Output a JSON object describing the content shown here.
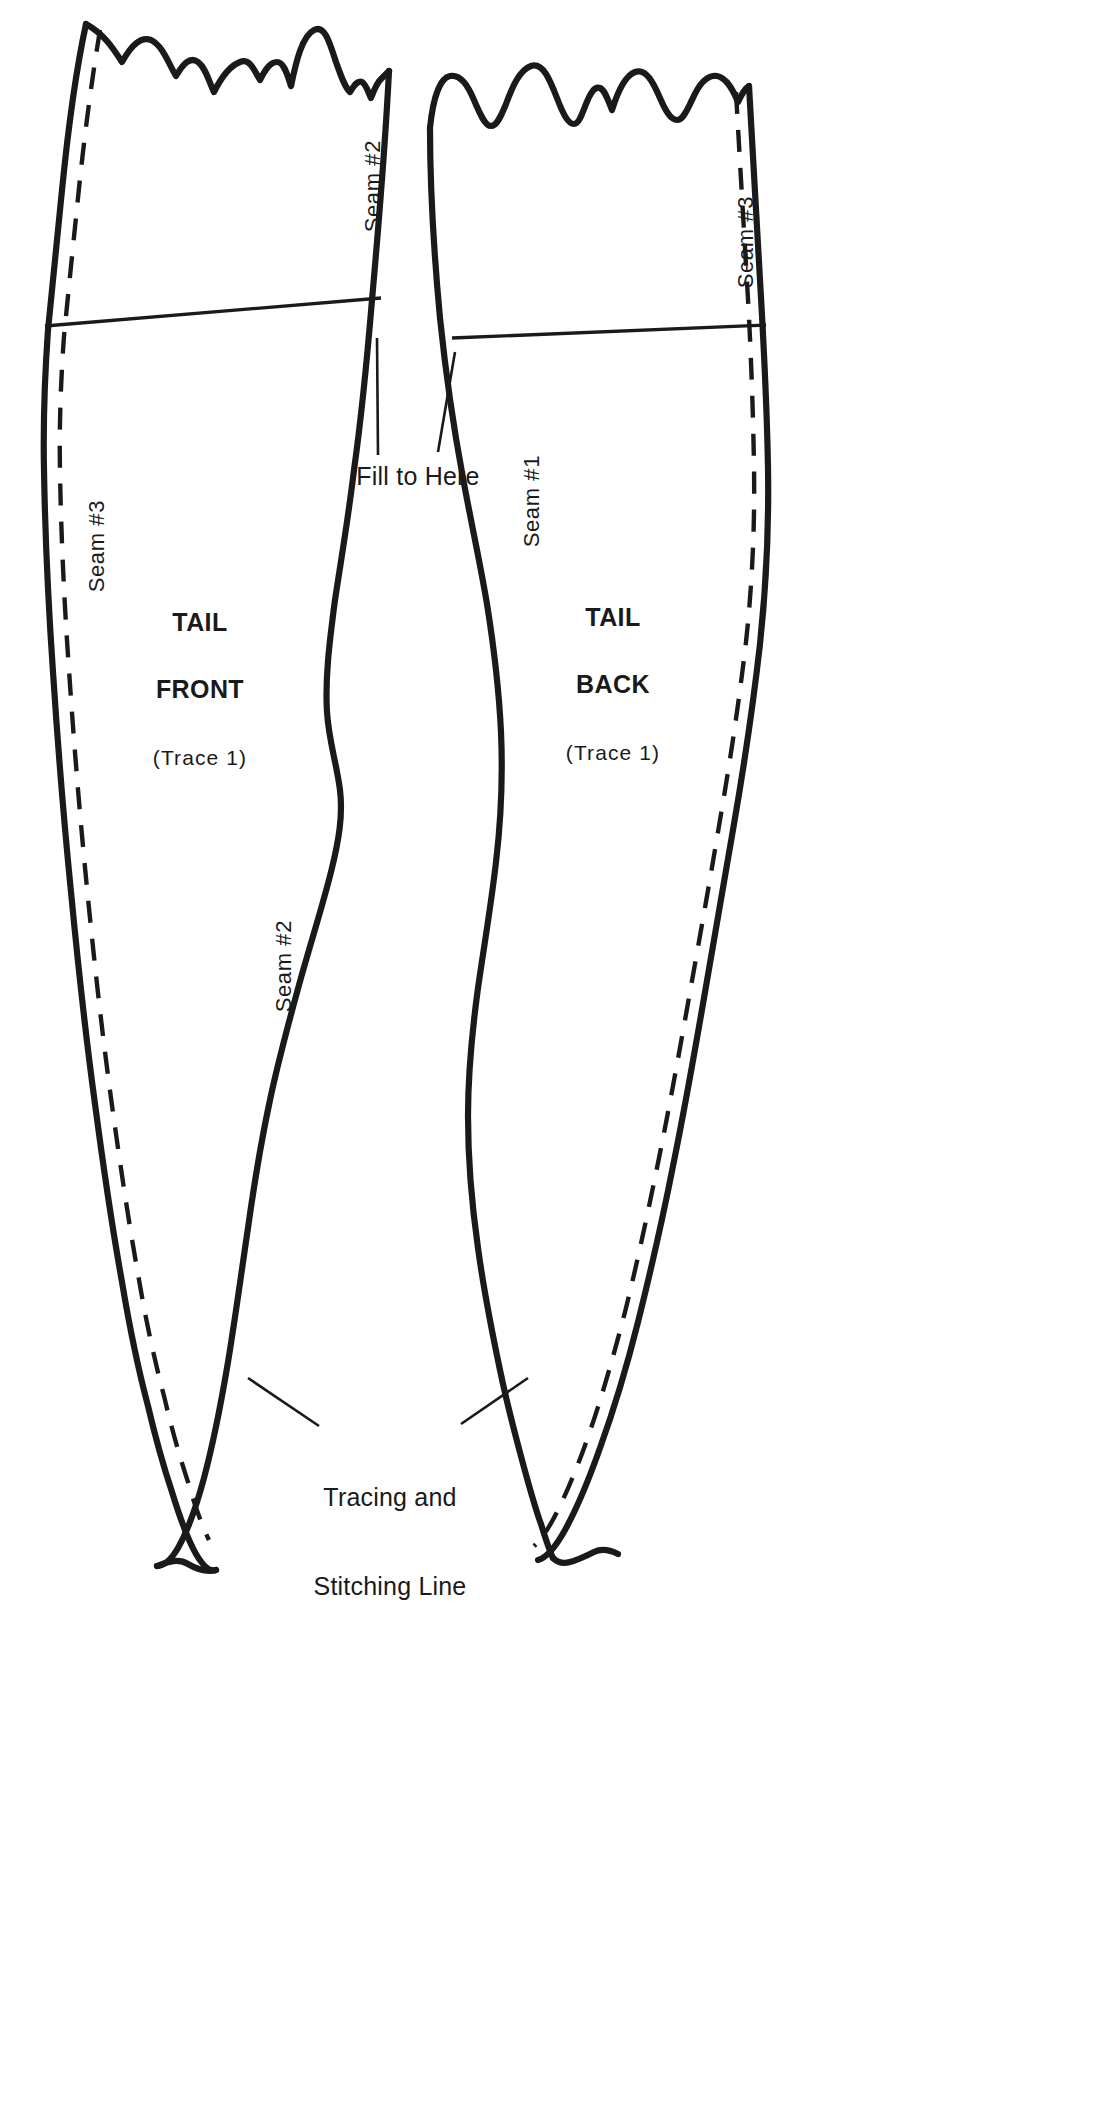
{
  "document": {
    "type": "sewing-pattern-template",
    "title": "Tail pattern pieces",
    "background_color": "#ffffff",
    "ink_color": "#1a1a1a"
  },
  "pieces": [
    {
      "id": "tail-front",
      "name_line1": "TAIL",
      "name_line2": "FRONT",
      "trace_note": "(Trace 1)"
    },
    {
      "id": "tail-back",
      "name_line1": "TAIL",
      "name_line2": "BACK",
      "trace_note": "(Trace 1)"
    }
  ],
  "seam_labels": [
    {
      "id": "front-right-upper",
      "text": "Seam #2"
    },
    {
      "id": "front-left",
      "text": "Seam #3"
    },
    {
      "id": "front-right-lower",
      "text": "Seam #2"
    },
    {
      "id": "back-right",
      "text": "Seam #3"
    },
    {
      "id": "back-left",
      "text": "Seam #1"
    }
  ],
  "callouts": [
    {
      "id": "fill-to-here",
      "text": "Fill to Here"
    },
    {
      "id": "tracing-line-1",
      "text": "Tracing and"
    },
    {
      "id": "tracing-line-2",
      "text": "Stitching Line"
    }
  ]
}
